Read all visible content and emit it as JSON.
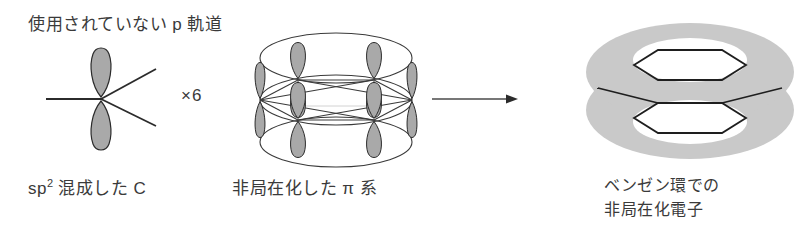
{
  "figure": {
    "title_caption": "使用されていない p 軌道",
    "width": 809,
    "height": 232,
    "background_color": "#ffffff"
  },
  "panels": {
    "left": {
      "caption_top": "使用されていない p 軌道",
      "label_bottom_prefix": "sp",
      "label_bottom_superscript": "2",
      "label_bottom_suffix": " 混成した C",
      "diagram": "sp2-hybridized-carbon-with-p-orbital"
    },
    "multiplier": {
      "label": "×6"
    },
    "middle": {
      "label_bottom": "非局在化した π 系",
      "diagram": "delocalized-pi-system-cylinder",
      "orbital_count": 6
    },
    "arrow": {
      "direction": "right",
      "x_start": 432,
      "x_end": 518,
      "y": 99
    },
    "right": {
      "label_bottom_line1": "ベンゼン環での",
      "label_bottom_line2": "非局在化電子",
      "diagram": "benzene-ring-delocalized-electron-clouds"
    }
  },
  "colors": {
    "ink": "#3a3a3a",
    "stroke": "#2b2b2b",
    "lobe_fill": "#a9a9a9",
    "cloud_fill": "#c9c9c9",
    "background": "#ffffff",
    "white": "#ffffff"
  },
  "icons": {
    "arrow": "arrow-right-icon",
    "p_orbital": "p-orbital-icon",
    "pi_cylinder": "pi-cylinder-icon",
    "benzene_cloud": "benzene-cloud-icon"
  }
}
